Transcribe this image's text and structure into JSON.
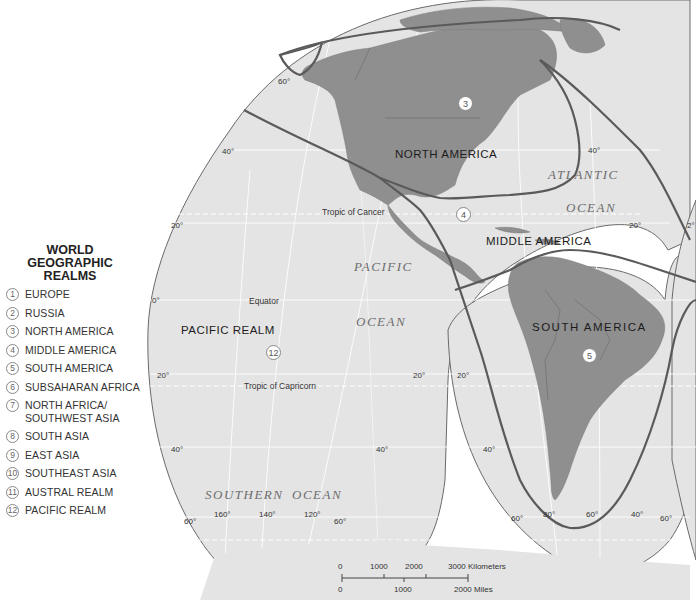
{
  "legend": {
    "title": "WORLD GEOGRAPHIC REALMS",
    "items": [
      {
        "num": "1",
        "label": "EUROPE"
      },
      {
        "num": "2",
        "label": "RUSSIA"
      },
      {
        "num": "3",
        "label": "NORTH AMERICA"
      },
      {
        "num": "4",
        "label": "MIDDLE AMERICA"
      },
      {
        "num": "5",
        "label": "SOUTH AMERICA"
      },
      {
        "num": "6",
        "label": "SUBSAHARAN AFRICA"
      },
      {
        "num": "7",
        "label": "NORTH AFRICA/\nSOUTHWEST ASIA"
      },
      {
        "num": "8",
        "label": "SOUTH ASIA"
      },
      {
        "num": "9",
        "label": "EAST ASIA"
      },
      {
        "num": "10",
        "label": "SOUTHEAST ASIA"
      },
      {
        "num": "11",
        "label": "AUSTRAL REALM"
      },
      {
        "num": "12",
        "label": "PACIFIC REALM"
      }
    ]
  },
  "map": {
    "realms": {
      "north_america": {
        "label": "NORTH AMERICA",
        "num": "3"
      },
      "middle_america": {
        "label": "MIDDLE AMERICA",
        "num": "4"
      },
      "south_america": {
        "label": "SOUTH AMERICA",
        "num": "5"
      },
      "pacific_realm": {
        "label": "PACIFIC REALM",
        "num": "12"
      }
    },
    "oceans": {
      "atlantic_1": "ATLANTIC",
      "atlantic_2": "OCEAN",
      "pacific_1": "PACIFIC",
      "pacific_2": "OCEAN",
      "southern_1": "SOUTHERN",
      "southern_2": "OCEAN"
    },
    "lines": {
      "tropic_cancer": "Tropic of Cancer",
      "equator": "Equator",
      "tropic_capricorn": "Tropic of Capricorn"
    },
    "lat_labels": {
      "n60": "60°",
      "n40_left": "40°",
      "n40_right": "40°",
      "n20_left": "20°",
      "n20_right": "20°",
      "n20_far": "2°",
      "eq": "0°",
      "s20_left": "20°",
      "s20_mid": "20°",
      "s20_sa": "20°",
      "s40_left": "40°",
      "s40_mid": "40°",
      "s40_sa": "40°",
      "s60_left": "60°",
      "s60_mid": "60°",
      "s60_sa_left": "60°",
      "s60_sa_right": "60°"
    },
    "lon_labels": {
      "w160": "160°",
      "w140": "140°",
      "w120": "120°",
      "w80": "80°",
      "w60": "60°",
      "w40": "40°"
    },
    "colors": {
      "ocean": "#e4e4e4",
      "land": "#8f8f8f",
      "boundary": "#5a5a5a",
      "background": "#ffffff"
    }
  },
  "scale_bar": {
    "km_ticks": [
      "0",
      "1000",
      "2000",
      "3000 Kilometers"
    ],
    "mi_ticks": [
      "0",
      "1000",
      "2000 Miles"
    ]
  }
}
